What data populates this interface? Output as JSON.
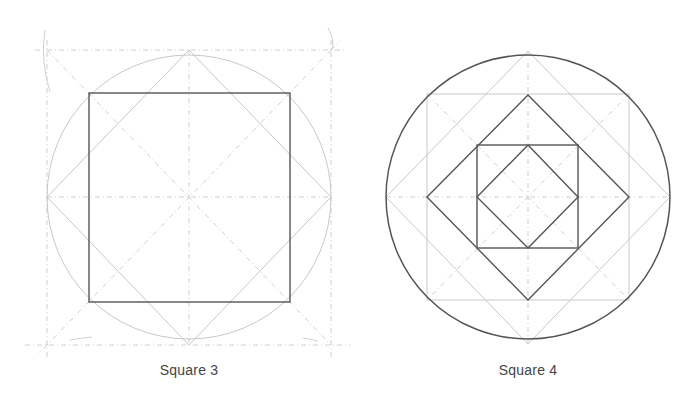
{
  "figures": [
    {
      "id": "square-3",
      "label": "Square 3",
      "description": "Square inscribed in circle with construction lines; dark square inside circle, light diamond touching circle at N/E/S/W, dashed bounding square and diagonals"
    },
    {
      "id": "square-4",
      "label": "Square 4",
      "description": "Nested squares and diamonds inside a dark circle: light outer diamond, light large square, dark medium diamond, dark small square, dark small diamond, dashed diagonals and axes"
    }
  ],
  "colors": {
    "construction": "#c8c8c8",
    "primary_line": "#555555",
    "label_text": "#444444",
    "background": "#ffffff"
  }
}
